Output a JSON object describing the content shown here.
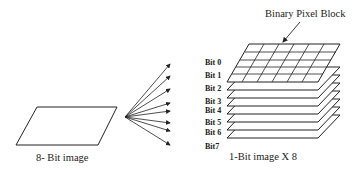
{
  "diagram": {
    "source_caption": "8- Bit image",
    "target_caption": "1-Bit image  X 8",
    "block_label": "Binary Pixel Block",
    "bits": [
      "Bit 0",
      "Bit 1",
      "Bit 2",
      "Bit 3",
      "Bit 4",
      "Bit 5",
      "Bit 6",
      "Bit7"
    ],
    "colors": {
      "stroke": "#222222",
      "background": "#ffffff"
    }
  }
}
